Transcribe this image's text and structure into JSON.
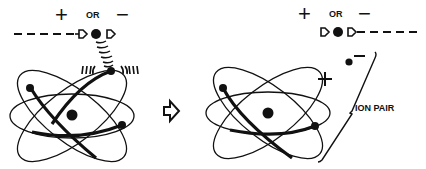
{
  "diagram": {
    "before": {
      "plus_sign": "+",
      "or_label": "OR",
      "minus_sign": "−",
      "particle": "incoming charged particle (+ or −) with dashed trajectory"
    },
    "transition_arrow": "arrow-right",
    "after": {
      "plus_sign": "+",
      "or_label": "OR",
      "minus_sign": "−",
      "electron_charge": "−",
      "ion_charge": "+",
      "ion_pair_label": "ION PAIR"
    },
    "colors": {
      "ink": "#111111",
      "background": "#ffffff"
    }
  }
}
